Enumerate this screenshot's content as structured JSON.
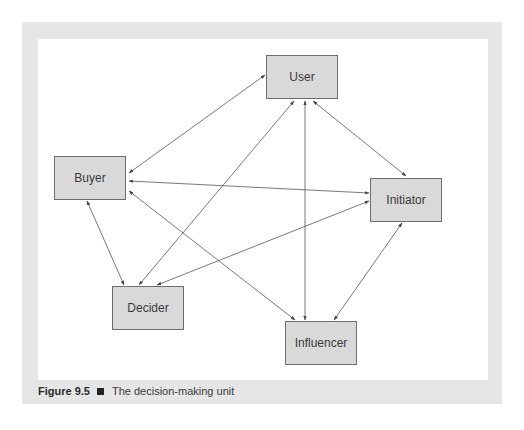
{
  "figure": {
    "number": "Figure 9.5",
    "separator_icon": "black-square",
    "caption": "The decision-making unit"
  },
  "diagram": {
    "type": "network",
    "edge_style": "double-headed-arrow",
    "colors": {
      "panel": "#e6e6e6",
      "canvas": "#ffffff",
      "node_fill": "#d9d9d9",
      "node_border": "#6e6e6e",
      "edge": "#444444"
    },
    "nodes": [
      {
        "id": "user",
        "label": "User"
      },
      {
        "id": "buyer",
        "label": "Buyer"
      },
      {
        "id": "initiator",
        "label": "Initiator"
      },
      {
        "id": "decider",
        "label": "Decider"
      },
      {
        "id": "influencer",
        "label": "Influencer"
      }
    ],
    "edges": [
      {
        "from": "user",
        "to": "buyer",
        "bidirectional": true
      },
      {
        "from": "user",
        "to": "initiator",
        "bidirectional": true
      },
      {
        "from": "user",
        "to": "decider",
        "bidirectional": true
      },
      {
        "from": "user",
        "to": "influencer",
        "bidirectional": true
      },
      {
        "from": "buyer",
        "to": "initiator",
        "bidirectional": true
      },
      {
        "from": "buyer",
        "to": "decider",
        "bidirectional": true
      },
      {
        "from": "buyer",
        "to": "influencer",
        "bidirectional": true
      },
      {
        "from": "initiator",
        "to": "decider",
        "bidirectional": true
      },
      {
        "from": "initiator",
        "to": "influencer",
        "bidirectional": true
      }
    ]
  }
}
